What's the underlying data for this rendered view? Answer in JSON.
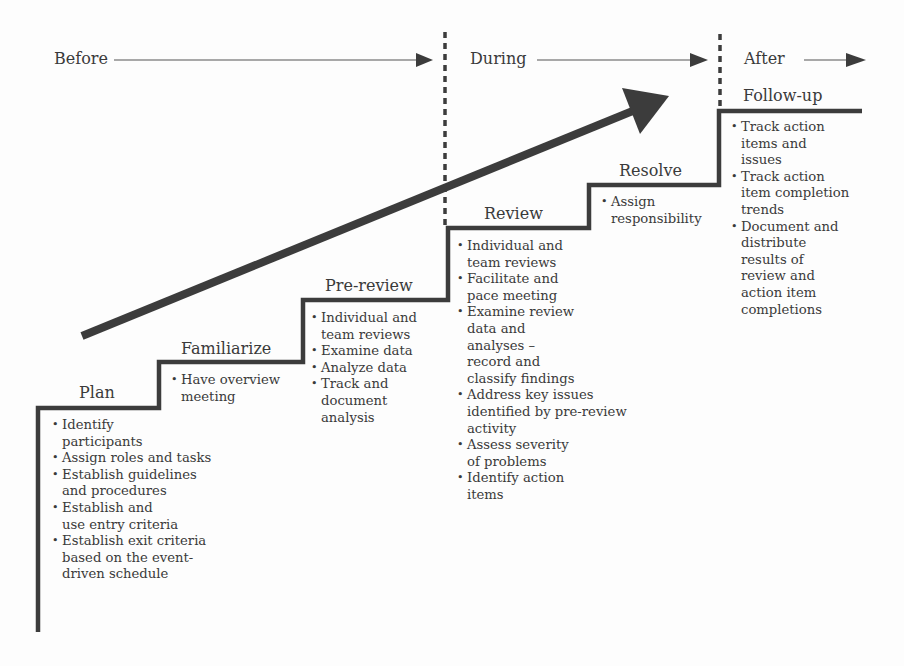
{
  "phases": [
    {
      "label": "Before"
    },
    {
      "label": "During"
    },
    {
      "label": "After"
    }
  ],
  "steps": [
    {
      "title": "Plan",
      "items": [
        "Identify\nparticipants",
        "Assign roles and tasks",
        "Establish guidelines\nand procedures",
        "Establish and\nuse entry criteria",
        "Establish exit criteria\nbased on the event-\ndriven schedule"
      ]
    },
    {
      "title": "Familiarize",
      "items": [
        "Have overview\nmeeting"
      ]
    },
    {
      "title": "Pre-review",
      "items": [
        "Individual and\nteam reviews",
        "Examine data",
        "Analyze data",
        "Track and\ndocument\nanalysis"
      ]
    },
    {
      "title": "Review",
      "items": [
        "Individual and\nteam reviews",
        "Facilitate and\npace meeting",
        "Examine review\ndata and\nanalyses –\nrecord and\nclassify findings",
        "Address key issues\nidentified by pre-review\nactivity",
        "Assess severity\nof problems",
        "Identify action\nitems"
      ]
    },
    {
      "title": "Resolve",
      "items": [
        "Assign\nresponsibility"
      ]
    },
    {
      "title": "Follow-up",
      "items": [
        "Track action\nitems and\nissues",
        "Track action\nitem completion\ntrends",
        "Document and\ndistribute\nresults of\nreview and\naction item\ncompletions"
      ]
    }
  ],
  "colors": {
    "line": "#3c3c3c",
    "text": "#3a3a3a",
    "background": "#fdfdfd"
  }
}
